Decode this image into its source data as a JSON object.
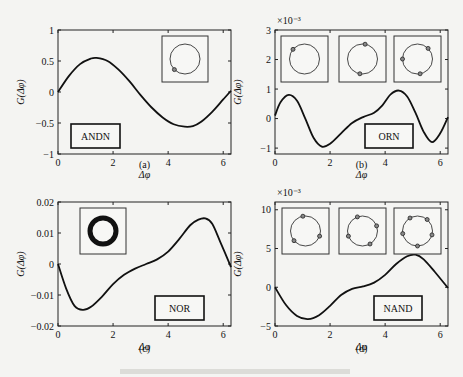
{
  "figure_caption": "",
  "chart_data": [
    {
      "id": "a",
      "type": "line",
      "panel_label": "(a)",
      "label_box": "ANDN",
      "xlabel": "Δφ",
      "ylabel": "G(Δφ)",
      "xlim": [
        0,
        6.283
      ],
      "ylim": [
        -1,
        1
      ],
      "xticks": [
        0,
        2,
        4,
        6
      ],
      "yticks": [
        -1,
        -0.5,
        0,
        0.5,
        1
      ],
      "ytick_labels": [
        "−1",
        "−0.5",
        "0",
        "0.5",
        "1"
      ],
      "exponent_label": "",
      "insets": [
        {
          "markers_deg": [
            225
          ]
        }
      ],
      "x": [
        0,
        0.4,
        0.8,
        1.2,
        1.4,
        1.8,
        2.2,
        2.6,
        3.0,
        3.4,
        3.8,
        4.2,
        4.6,
        4.9,
        5.2,
        5.6,
        6.0,
        6.283
      ],
      "y": [
        0.0,
        0.26,
        0.45,
        0.54,
        0.55,
        0.5,
        0.36,
        0.17,
        -0.05,
        -0.25,
        -0.41,
        -0.52,
        -0.56,
        -0.55,
        -0.48,
        -0.32,
        -0.12,
        0.02
      ]
    },
    {
      "id": "b",
      "type": "line",
      "panel_label": "(b)",
      "label_box": "ORN",
      "xlabel": "Δφ",
      "ylabel": "G(Δφ)",
      "xlim": [
        0,
        6.283
      ],
      "ylim": [
        -1.2,
        3
      ],
      "xticks": [
        0,
        2,
        4,
        6
      ],
      "yticks": [
        -1,
        0,
        1,
        2,
        3
      ],
      "ytick_labels": [
        "−1",
        "0",
        "1",
        "2",
        "3"
      ],
      "exponent_label": "×10⁻³",
      "insets": [
        {
          "markers_deg": [
            140
          ]
        },
        {
          "markers_deg": [
            80,
            260
          ]
        },
        {
          "markers_deg": [
            45,
            180,
            280
          ]
        }
      ],
      "x": [
        0,
        0.2,
        0.5,
        0.8,
        1.1,
        1.4,
        1.7,
        2.0,
        2.4,
        2.8,
        3.2,
        3.6,
        3.9,
        4.2,
        4.5,
        4.8,
        5.1,
        5.4,
        5.7,
        6.0,
        6.283
      ],
      "y": [
        0.1,
        0.55,
        0.8,
        0.6,
        0.0,
        -0.65,
        -0.95,
        -0.85,
        -0.5,
        -0.15,
        0.05,
        0.2,
        0.45,
        0.82,
        0.95,
        0.75,
        0.2,
        -0.45,
        -0.8,
        -0.5,
        0.05
      ]
    },
    {
      "id": "c",
      "type": "line",
      "panel_label": "(c)",
      "label_box": "NOR",
      "xlabel": "Δφ",
      "ylabel": "G(Δφ)",
      "xlim": [
        0,
        6.283
      ],
      "ylim": [
        -0.02,
        0.02
      ],
      "xticks": [
        0,
        2,
        4,
        6
      ],
      "yticks": [
        -0.02,
        -0.01,
        0,
        0.01,
        0.02
      ],
      "ytick_labels": [
        "−0.02",
        "−0.01",
        "0",
        "0.01",
        "0.02"
      ],
      "exponent_label": "",
      "insets": [
        {
          "markers_deg": [],
          "thick_ring": true
        }
      ],
      "x": [
        0,
        0.3,
        0.6,
        0.9,
        1.2,
        1.6,
        2.0,
        2.4,
        2.8,
        3.2,
        3.6,
        4.0,
        4.4,
        4.8,
        5.1,
        5.35,
        5.6,
        5.9,
        6.283
      ],
      "y": [
        0.0,
        -0.008,
        -0.0135,
        -0.0148,
        -0.0138,
        -0.0105,
        -0.0065,
        -0.0035,
        -0.0015,
        0.0,
        0.0015,
        0.004,
        0.008,
        0.0125,
        0.0143,
        0.0147,
        0.013,
        0.007,
        -0.001
      ]
    },
    {
      "id": "d",
      "type": "line",
      "panel_label": "(d)",
      "label_box": "NAND",
      "xlabel": "Δφ",
      "ylabel": "G(Δφ)",
      "xlim": [
        0,
        6.283
      ],
      "ylim": [
        -5,
        11
      ],
      "xticks": [
        0,
        2,
        4,
        6
      ],
      "yticks": [
        -5,
        0,
        5,
        10
      ],
      "ytick_labels": [
        "−5",
        "0",
        "5",
        "10"
      ],
      "exponent_label": "×10⁻³",
      "insets": [
        {
          "markers_deg": [
            100,
            220,
            340
          ]
        },
        {
          "markers_deg": [
            110,
            200,
            300,
            20
          ]
        },
        {
          "markers_deg": [
            120,
            190,
            270,
            345,
            50
          ]
        }
      ],
      "x": [
        0,
        0.4,
        0.8,
        1.2,
        1.6,
        2.0,
        2.4,
        2.8,
        3.2,
        3.6,
        4.0,
        4.4,
        4.8,
        5.1,
        5.4,
        5.8,
        6.283
      ],
      "y": [
        0.0,
        -2.3,
        -3.7,
        -4.1,
        -3.6,
        -2.4,
        -1.0,
        -0.2,
        0.1,
        0.6,
        1.6,
        3.0,
        4.0,
        4.2,
        3.6,
        2.0,
        -0.1
      ]
    }
  ]
}
